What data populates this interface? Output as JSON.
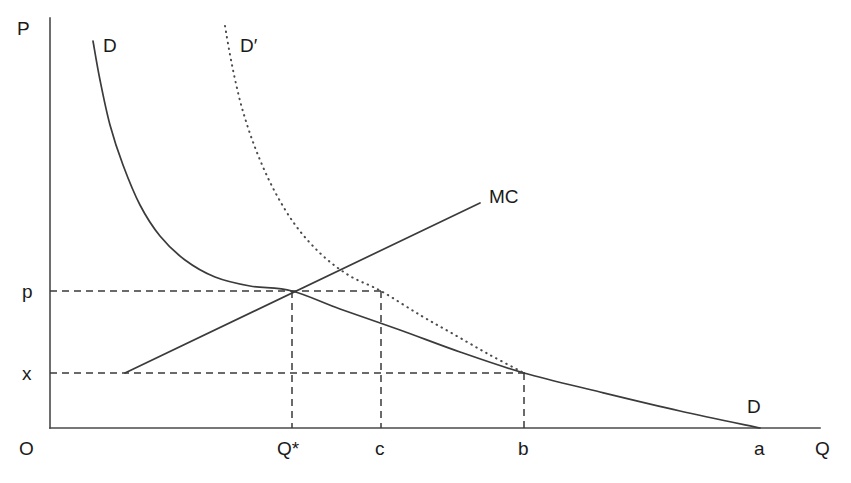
{
  "chart_data": {
    "type": "line",
    "title": "",
    "xlabel": "Q",
    "ylabel": "P",
    "origin_label": "O",
    "grid": false,
    "legend": "inline-curve-labels",
    "axis_pixel_geometry": {
      "y_axis_x": 50,
      "y_axis_top": 18,
      "x_axis_y": 428,
      "x_axis_right": 820
    },
    "y_ticks": [
      {
        "label": "p",
        "pixel_y": 291
      },
      {
        "label": "x",
        "pixel_y": 373
      }
    ],
    "x_ticks": [
      {
        "label": "Q*",
        "pixel_x": 292
      },
      {
        "label": "c",
        "pixel_x": 381
      },
      {
        "label": "b",
        "pixel_x": 524
      },
      {
        "label": "a",
        "pixel_x": 760
      }
    ],
    "series": [
      {
        "name": "D",
        "style": "solid",
        "label": "D",
        "description": "original demand curve, convex decreasing",
        "points": [
          [
            93,
            41
          ],
          [
            100,
            80
          ],
          [
            110,
            125
          ],
          [
            123,
            165
          ],
          [
            140,
            205
          ],
          [
            160,
            236
          ],
          [
            185,
            260
          ],
          [
            215,
            277
          ],
          [
            250,
            286
          ],
          [
            292,
            291
          ],
          [
            340,
            309
          ],
          [
            400,
            330
          ],
          [
            460,
            352
          ],
          [
            524,
            373
          ],
          [
            600,
            392
          ],
          [
            680,
            411
          ],
          [
            760,
            428
          ]
        ]
      },
      {
        "name": "D-prime",
        "style": "dotted",
        "label": "D′",
        "description": "shifted demand curve, dotted, convex decreasing, converges to D at b",
        "points": [
          [
            225,
            26
          ],
          [
            232,
            65
          ],
          [
            242,
            108
          ],
          [
            256,
            150
          ],
          [
            274,
            190
          ],
          [
            296,
            226
          ],
          [
            322,
            255
          ],
          [
            350,
            276
          ],
          [
            381,
            291
          ],
          [
            420,
            315
          ],
          [
            455,
            335
          ],
          [
            490,
            355
          ],
          [
            524,
            373
          ]
        ]
      },
      {
        "name": "MC",
        "style": "solid-straight",
        "label": "MC",
        "description": "marginal cost, upward sloping straight line",
        "points": [
          [
            125,
            373
          ],
          [
            480,
            203
          ]
        ]
      }
    ],
    "guides": [
      {
        "name": "p-horizontal",
        "from": [
          50,
          291
        ],
        "to": [
          382,
          291
        ]
      },
      {
        "name": "x-horizontal",
        "from": [
          50,
          373
        ],
        "to": [
          525,
          373
        ]
      },
      {
        "name": "q-star-vertical",
        "from": [
          292,
          291
        ],
        "to": [
          292,
          428
        ]
      },
      {
        "name": "c-vertical",
        "from": [
          381,
          291
        ],
        "to": [
          381,
          428
        ]
      },
      {
        "name": "b-vertical",
        "from": [
          524,
          373
        ],
        "to": [
          524,
          428
        ]
      }
    ],
    "curve_labels": [
      {
        "text": "D",
        "pixel_x": 105,
        "pixel_y": 37,
        "curve": "D",
        "position": "top"
      },
      {
        "text": "D′",
        "pixel_x": 242,
        "pixel_y": 37,
        "curve": "D-prime",
        "position": "top"
      },
      {
        "text": "MC",
        "pixel_x": 490,
        "pixel_y": 188,
        "curve": "MC",
        "position": "end"
      },
      {
        "text": "D",
        "pixel_x": 749,
        "pixel_y": 398,
        "curve": "D",
        "position": "end"
      }
    ],
    "colors": {
      "background": "#ffffff",
      "axis": "#4a4a4a",
      "curve": "#3b3b3b",
      "dotted_curve": "#4b4b4b",
      "guide": "#3a3a3a",
      "text": "#1a1a1a"
    }
  },
  "labels": {
    "p_axis": "P",
    "q_axis": "Q",
    "origin": "O",
    "tick_p": "p",
    "tick_x": "x",
    "tick_qstar": "Q*",
    "tick_c": "c",
    "tick_b": "b",
    "tick_a": "a",
    "curve_d_top": "D",
    "curve_dprime_top": "D′",
    "curve_mc": "MC",
    "curve_d_end": "D"
  }
}
